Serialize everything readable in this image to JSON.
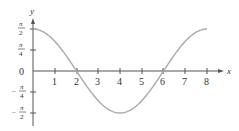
{
  "chart_data": {
    "type": "line",
    "title": "",
    "xlabel": "x",
    "ylabel": "y",
    "function": "y = (π/2)·cos(πx/4)",
    "x_ticks": [
      "1",
      "2",
      "3",
      "4",
      "5",
      "6",
      "7",
      "8"
    ],
    "y_ticks": [
      {
        "value": 1.5708,
        "num": "π",
        "den": "2",
        "sign": ""
      },
      {
        "value": 0.7854,
        "num": "π",
        "den": "4",
        "sign": ""
      },
      {
        "value": 0,
        "label": "0"
      },
      {
        "value": -0.7854,
        "num": "π",
        "den": "4",
        "sign": "−"
      },
      {
        "value": -1.5708,
        "num": "π",
        "den": "2",
        "sign": "−"
      }
    ],
    "xlim": [
      0,
      8
    ],
    "ylim": [
      -1.5708,
      1.5708
    ],
    "grid": false,
    "series": [
      {
        "name": "curve",
        "x": [
          0,
          0.5,
          1,
          1.5,
          2,
          2.5,
          3,
          3.5,
          4,
          4.5,
          5,
          5.5,
          6,
          6.5,
          7,
          7.5,
          8
        ],
        "y": [
          1.571,
          1.451,
          1.111,
          0.601,
          0,
          -0.601,
          -1.111,
          -1.451,
          -1.571,
          -1.451,
          -1.111,
          -0.601,
          0,
          0.601,
          1.111,
          1.451,
          1.571
        ]
      }
    ],
    "colors": {
      "curve": "#a9a9a9",
      "axis": "#555555",
      "text": "#333333"
    }
  },
  "labels": {
    "x_axis": "x",
    "y_axis": "y",
    "zero": "0",
    "pi": "π",
    "two": "2",
    "four": "4",
    "minus": "−",
    "x1": "1",
    "x2": "2",
    "x3": "3",
    "x4": "4",
    "x5": "5",
    "x6": "6",
    "x7": "7",
    "x8": "8"
  }
}
